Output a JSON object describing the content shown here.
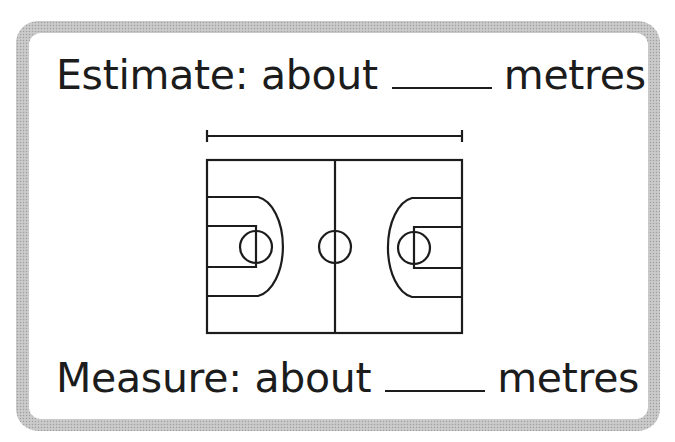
{
  "worksheet": {
    "estimate_label": "Estimate: about",
    "estimate_unit": "metres",
    "estimate_answer": "",
    "measure_label": "Measure: about",
    "measure_unit": "metres",
    "measure_answer": ""
  },
  "illustration": {
    "subject": "basketball-court",
    "measure_bar": "length-indicator-above-court",
    "stroke_color": "#1c1c1c",
    "frame_color": "#c4c4c4"
  }
}
